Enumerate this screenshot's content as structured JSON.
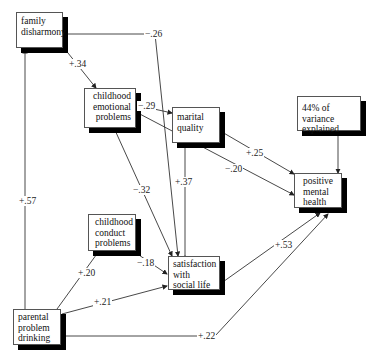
{
  "nodes": {
    "family_disharmony": {
      "line1": "family",
      "line2": "disharmony"
    },
    "childhood_emotional": {
      "line1": "childhood",
      "line2": "emotional",
      "line3": "problems"
    },
    "marital_quality": {
      "line1": "marital",
      "line2": "quality"
    },
    "variance": {
      "line1": "44% of variance",
      "line2": "explained"
    },
    "positive_mental_health": {
      "line1": "positive",
      "line2": "mental",
      "line3": "health"
    },
    "childhood_conduct": {
      "line1": "childhood",
      "line2": "conduct",
      "line3": "problems"
    },
    "satisfaction": {
      "line1": "satisfaction",
      "line2": "with",
      "line3": "social life"
    },
    "parental_drinking": {
      "line1": "parental",
      "line2": "problem",
      "line3": "drinking"
    }
  },
  "paths": {
    "fam_to_emo": "+.34",
    "fam_to_sat": "−.26",
    "emo_to_mar": "−.29",
    "emo_to_pmh": "−.20",
    "emo_to_sat": "−.32",
    "mar_to_pmh": "+.25",
    "sat_to_mar": "+.37",
    "par_to_fam": "+.57",
    "par_to_con": "+.20",
    "con_to_sat": "−.18",
    "par_to_sat": "+.21",
    "sat_to_pmh": "+.53",
    "par_to_pmh": "+.22"
  }
}
